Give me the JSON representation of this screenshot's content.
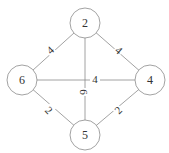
{
  "graph": {
    "nodes": [
      {
        "id": "n2",
        "label": "2",
        "x": 85,
        "y": 23
      },
      {
        "id": "n6",
        "label": "6",
        "x": 22,
        "y": 80
      },
      {
        "id": "n4",
        "label": "4",
        "x": 150,
        "y": 80
      },
      {
        "id": "n5",
        "label": "5",
        "x": 85,
        "y": 135
      }
    ],
    "edges": [
      {
        "from": "n2",
        "to": "n6",
        "label": "4",
        "lx": 50,
        "ly": 50,
        "rot": -42
      },
      {
        "from": "n2",
        "to": "n4",
        "label": "4",
        "lx": 119,
        "ly": 50,
        "rot": 42
      },
      {
        "from": "n6",
        "to": "n4",
        "label": "4",
        "lx": 95,
        "ly": 79,
        "rot": 0
      },
      {
        "from": "n2",
        "to": "n5",
        "label": "6",
        "lx": 84,
        "ly": 92,
        "rot": 90
      },
      {
        "from": "n6",
        "to": "n5",
        "label": "2",
        "lx": 49,
        "ly": 110,
        "rot": 45
      },
      {
        "from": "n4",
        "to": "n5",
        "label": "2",
        "lx": 118,
        "ly": 110,
        "rot": -45
      }
    ],
    "node_radius": 15,
    "colors": {
      "stroke": "#8a8a8a",
      "text": "#333333",
      "background": "#ffffff"
    }
  }
}
